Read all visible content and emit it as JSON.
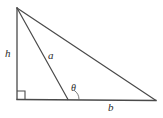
{
  "figure": {
    "kind": "geometry-diagram",
    "background_color": "#ffffff",
    "stroke_color": "#4a4a4a",
    "label_color": "#2b2b2b",
    "labels": {
      "height": "h",
      "cevian": "a",
      "angle": "θ",
      "base": "b"
    },
    "geometry": {
      "apex": {
        "x": 17,
        "y": 8
      },
      "bottom_left": {
        "x": 17,
        "y": 99
      },
      "bottom_right": {
        "x": 156,
        "y": 100
      },
      "cevian_foot": {
        "x": 68,
        "y": 99
      },
      "right_angle_marker": {
        "x": 17,
        "y": 99,
        "size": 8
      },
      "angle_arc": {
        "cx": 68,
        "cy": 99,
        "radius": 11
      }
    }
  }
}
